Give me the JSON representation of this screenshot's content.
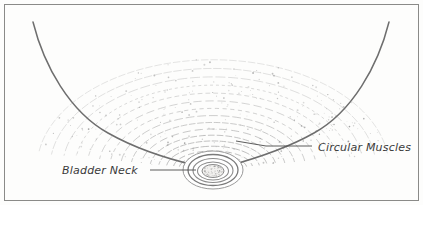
{
  "figure": {
    "kind": "anatomical-illustration",
    "width": 423,
    "height": 205,
    "background_color": "#fdfdfc",
    "border_color": "#8a8a88",
    "outline_color": "#6e6e6e",
    "arc_color": "#9a9a9a",
    "text_color": "#3a3a3a"
  },
  "labels": [
    {
      "id": "bladder-neck",
      "text": "Bladder Neck",
      "text_x": 62,
      "text_y": 174,
      "anchor": "start",
      "leader": "M 150 170 L 196 170"
    },
    {
      "id": "circular-muscles",
      "text": "Circular Muscles",
      "text_x": 318,
      "text_y": 151,
      "anchor": "start",
      "leader": "M 236 141 L 266 146 L 312 146"
    }
  ],
  "geometry": {
    "frame": {
      "x": 4.5,
      "y": 4.5,
      "width": 414,
      "height": 196
    },
    "wall_left": "M 33 22 C 44 66 70 112 108 133 C 138 150 172 160 198 166",
    "wall_right": "M 389 22 C 378 66 352 112 314 133 C 284 150 250 160 228 166",
    "neck_center_x": 213,
    "neck_center_y": 170,
    "neck_rings": [
      {
        "rx": 25,
        "ry": 15.5
      },
      {
        "rx": 20,
        "ry": 12
      },
      {
        "rx": 15.5,
        "ry": 9
      }
    ],
    "neck_lumen": {
      "rx": 11,
      "ry": 6.5
    }
  },
  "arc_field": {
    "description": "Concentric dashed elliptical arcs representing circular muscle bundles converging on the bladder neck",
    "count": 16,
    "center_x": 213,
    "center_y": 168,
    "rx_min": 30,
    "rx_max": 176,
    "ry_min": 13,
    "ry_max": 132,
    "sweep_start_deg": 188,
    "sweep_end_deg": 352
  },
  "stipple": {
    "description": "Scattered dots giving shaded texture, densest in the lower funnel and right flank",
    "count": 230,
    "color": "#a8a8a8"
  }
}
